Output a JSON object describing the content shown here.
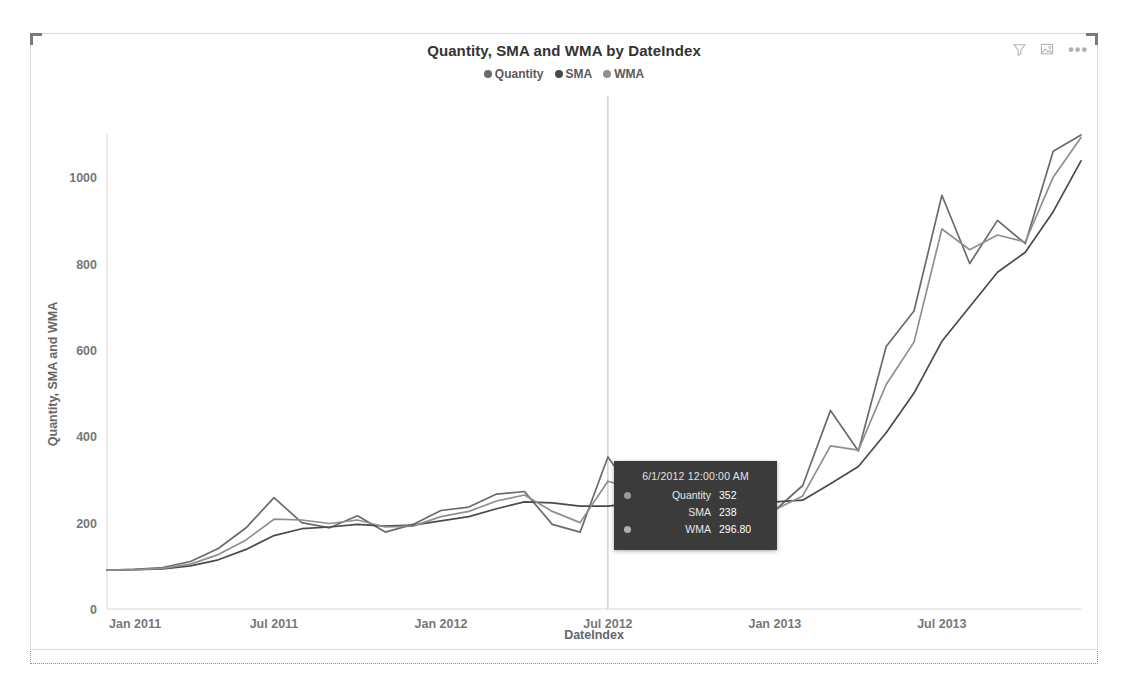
{
  "visual": {
    "title": "Quantity, SMA and WMA by DateIndex",
    "icons": [
      {
        "name": "filter-icon",
        "label": "Filters"
      },
      {
        "name": "focus-mode-icon",
        "label": "Focus mode"
      },
      {
        "name": "more-options-icon",
        "label": "More options"
      }
    ],
    "more_options_glyph": "•••"
  },
  "legend": {
    "position": "top",
    "items": [
      {
        "label": "Quantity",
        "color": "#6b6b6b"
      },
      {
        "label": "SMA",
        "color": "#4a4a4a"
      },
      {
        "label": "WMA",
        "color": "#8f8f8f"
      }
    ]
  },
  "tooltip": {
    "date": "6/1/2012 12:00:00 AM",
    "rows": [
      {
        "name": "Quantity",
        "value": "352",
        "color": "#9a9a9a",
        "has_marker": true
      },
      {
        "name": "SMA",
        "value": "238",
        "color": "#3b3b3b",
        "has_marker": false
      },
      {
        "name": "WMA",
        "value": "296.80",
        "color": "#b0b0b0",
        "has_marker": true
      }
    ]
  },
  "chart_data": {
    "type": "line",
    "title": "Quantity, SMA and WMA by DateIndex",
    "xlabel": "DateIndex",
    "ylabel": "Quantity, SMA and WMA",
    "ylim": [
      0,
      1100
    ],
    "yticks": [
      0,
      200,
      400,
      600,
      800,
      1000
    ],
    "ytick_labels": [
      "0",
      "200",
      "400",
      "600",
      "800",
      "1000"
    ],
    "xtick_labels": [
      "Jan 2011",
      "Jul 2011",
      "Jan 2012",
      "Jul 2012",
      "Jan 2013",
      "Jul 2013"
    ],
    "xtick_indices": [
      0,
      6,
      12,
      18,
      24,
      30
    ],
    "grid": false,
    "legend_position": "top",
    "x": [
      "Jan 2011",
      "Feb 2011",
      "Mar 2011",
      "Apr 2011",
      "May 2011",
      "Jun 2011",
      "Jul 2011",
      "Aug 2011",
      "Sep 2011",
      "Oct 2011",
      "Nov 2011",
      "Dec 2011",
      "Jan 2012",
      "Feb 2012",
      "Mar 2012",
      "Apr 2012",
      "May 2012",
      "Jun 2012",
      "Jul 2012",
      "Aug 2012",
      "Sep 2012",
      "Oct 2012",
      "Nov 2012",
      "Dec 2012",
      "Jan 2013",
      "Feb 2013",
      "Mar 2013",
      "Apr 2013",
      "May 2013",
      "Jun 2013",
      "Jul 2013",
      "Aug 2013",
      "Sep 2013",
      "Oct 2013",
      "Nov 2013",
      "Dec 2013"
    ],
    "series": [
      {
        "name": "Quantity",
        "color": "#6b6b6b",
        "values": [
          90,
          92,
          96,
          110,
          140,
          188,
          258,
          200,
          188,
          216,
          178,
          196,
          228,
          236,
          266,
          272,
          196,
          178,
          352,
          262,
          276,
          276,
          250,
          190,
          228,
          286,
          460,
          366,
          608,
          690,
          958,
          800,
          900,
          846,
          1060,
          1098
        ]
      },
      {
        "name": "SMA",
        "color": "#4a4a4a",
        "values": [
          90,
          91,
          93,
          100,
          114,
          138,
          170,
          186,
          190,
          196,
          192,
          194,
          204,
          214,
          232,
          248,
          246,
          238,
          238,
          246,
          258,
          266,
          268,
          256,
          248,
          252,
          290,
          330,
          408,
          500,
          620,
          700,
          780,
          826,
          920,
          1038
        ]
      },
      {
        "name": "WMA",
        "color": "#8f8f8f",
        "values": [
          90,
          91,
          94,
          104,
          126,
          160,
          208,
          206,
          198,
          206,
          190,
          192,
          214,
          226,
          250,
          264,
          226,
          200,
          296,
          278,
          278,
          280,
          266,
          224,
          230,
          262,
          378,
          368,
          520,
          618,
          880,
          832,
          866,
          850,
          1000,
          1092
        ]
      }
    ],
    "hover": {
      "x_value": "Jun 2012",
      "x_index": 18,
      "tracking_line": true,
      "quantity": 352,
      "sma": 238,
      "wma": 296.8
    }
  }
}
